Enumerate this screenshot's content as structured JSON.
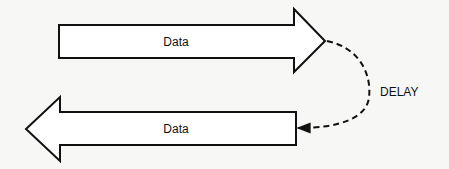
{
  "diagram": {
    "top_arrow": {
      "label": "Data",
      "direction": "right"
    },
    "bottom_arrow": {
      "label": "Data",
      "direction": "left"
    },
    "connector": {
      "label": "DELAY",
      "style": "dashed",
      "direction": "from top arrow tip to bottom arrow tail"
    },
    "colors": {
      "stroke": "#111111",
      "fill": "#ffffff",
      "background": "#f7f7f5"
    }
  }
}
